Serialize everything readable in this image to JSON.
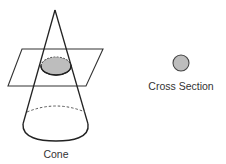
{
  "diagram": {
    "type": "geometry-cross-section",
    "labels": {
      "cone": "Cone",
      "cross_section": "Cross Section"
    },
    "colors": {
      "stroke": "#222222",
      "plane_stroke": "#333333",
      "fill_section": "#bdbdbd",
      "background": "#ffffff"
    },
    "cone": {
      "apex": [
        55,
        10
      ],
      "base_center": [
        56,
        124
      ],
      "base_rx": 33,
      "base_ry": 17
    },
    "plane": {
      "points": [
        [
          22,
          49
        ],
        [
          103,
          49
        ],
        [
          86,
          86
        ],
        [
          8,
          86
        ]
      ]
    },
    "section_ellipse": {
      "center": [
        56,
        66
      ],
      "rx": 15,
      "ry": 9
    },
    "cross_section_circle": {
      "center": [
        181,
        63
      ],
      "r": 8
    }
  }
}
